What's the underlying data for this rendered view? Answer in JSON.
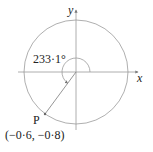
{
  "diagram": {
    "type": "unit-circle",
    "axes": {
      "x_label": "x",
      "y_label": "y"
    },
    "angle": {
      "label": "233·1°",
      "degrees": 233.1
    },
    "point": {
      "name": "P",
      "coords_label": "(−0·6, −0·8)",
      "x": -0.6,
      "y": -0.8
    },
    "colors": {
      "line": "#9a9a9a",
      "text": "#222222"
    }
  }
}
